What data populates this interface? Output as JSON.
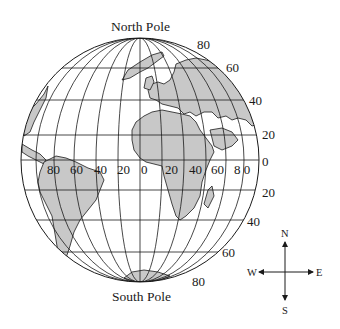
{
  "diagram": {
    "type": "globe",
    "title_top": "North Pole",
    "title_bottom": "South Pole",
    "land_color": "#c8c8c8",
    "line_color": "#1a1a1a",
    "latitude_labels": [
      {
        "value": "80",
        "hemisphere": "N"
      },
      {
        "value": "60",
        "hemisphere": "N"
      },
      {
        "value": "40",
        "hemisphere": "N"
      },
      {
        "value": "20",
        "hemisphere": "N"
      },
      {
        "value": "0",
        "hemisphere": "equator"
      },
      {
        "value": "20",
        "hemisphere": "S"
      },
      {
        "value": "40",
        "hemisphere": "S"
      },
      {
        "value": "60",
        "hemisphere": "S"
      },
      {
        "value": "80",
        "hemisphere": "S"
      }
    ],
    "longitude_labels": [
      "80",
      "60",
      "40",
      "20",
      "0",
      "20",
      "40",
      "60",
      "8 0"
    ],
    "continents": [
      "North America",
      "South America",
      "Europe",
      "Africa",
      "Asia",
      "Antarctica",
      "Greenland",
      "Madagascar"
    ],
    "compass": {
      "north": "N",
      "south": "S",
      "east": "E",
      "west": "W"
    }
  }
}
